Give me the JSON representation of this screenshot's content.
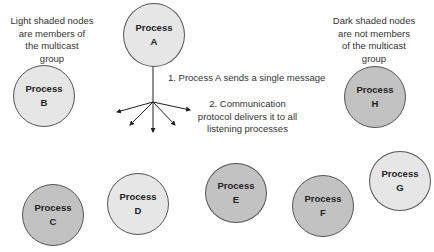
{
  "legend": {
    "light": [
      "Light shaded nodes",
      "are members of",
      "the multicast",
      "group"
    ],
    "dark": [
      "Dark shaded nodes",
      "are not members",
      "of the multicast",
      "group"
    ]
  },
  "steps": {
    "step1": "1. Process A sends a single message",
    "step2": [
      "2. Communication",
      "protocol delivers it to all",
      "listening processes"
    ]
  },
  "nodes": [
    {
      "id": "A",
      "label": "Process",
      "letter": "A",
      "shade": "light"
    },
    {
      "id": "B",
      "label": "Process",
      "letter": "B",
      "shade": "light"
    },
    {
      "id": "H",
      "label": "Process",
      "letter": "H",
      "shade": "dark"
    },
    {
      "id": "C",
      "label": "Process",
      "letter": "C",
      "shade": "dark"
    },
    {
      "id": "D",
      "label": "Process",
      "letter": "D",
      "shade": "light"
    },
    {
      "id": "E",
      "label": "Process",
      "letter": "E",
      "shade": "dark"
    },
    {
      "id": "F",
      "label": "Process",
      "letter": "F",
      "shade": "dark"
    },
    {
      "id": "G",
      "label": "Process",
      "letter": "G",
      "shade": "light"
    }
  ],
  "colors": {
    "light_node": "#e6e6e6",
    "dark_node": "#c2c2c2",
    "outline": "#555555"
  }
}
